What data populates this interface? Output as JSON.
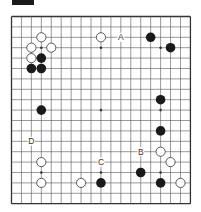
{
  "diagram": {
    "board_size": 19,
    "origin": {
      "x": 11.5,
      "y": 16.5
    },
    "spacing": {
      "x": 9.94,
      "y": 10.4
    },
    "colors": {
      "line": "#555555",
      "border": "#333333",
      "black_stone": "#1a1a1a",
      "white_stone_fill": "#ffffff",
      "white_stone_stroke": "#333333",
      "label": "#333333",
      "header": "#1a1a1a"
    },
    "star_points": [
      [
        3,
        3
      ],
      [
        9,
        3
      ],
      [
        15,
        3
      ],
      [
        3,
        9
      ],
      [
        9,
        9
      ],
      [
        15,
        9
      ],
      [
        3,
        15
      ],
      [
        9,
        15
      ],
      [
        15,
        15
      ]
    ],
    "white_stones": [
      [
        3,
        2
      ],
      [
        2,
        3
      ],
      [
        4,
        3
      ],
      [
        2,
        4
      ],
      [
        9,
        2
      ],
      [
        15,
        13
      ],
      [
        16,
        14
      ],
      [
        17,
        16
      ],
      [
        3,
        14
      ],
      [
        3,
        16
      ],
      [
        7,
        16
      ]
    ],
    "black_stones": [
      [
        3,
        4
      ],
      [
        2,
        5
      ],
      [
        3,
        5
      ],
      [
        14,
        2
      ],
      [
        16,
        3
      ],
      [
        15,
        8
      ],
      [
        15,
        11
      ],
      [
        13,
        15
      ],
      [
        15,
        16
      ],
      [
        3,
        9
      ],
      [
        9,
        16
      ]
    ],
    "labels": [
      {
        "text": "A",
        "col": 11,
        "row": 2
      },
      {
        "text": "B",
        "col": 13,
        "row": 13
      },
      {
        "text": "C",
        "col": 9,
        "row": 14
      },
      {
        "text": "D",
        "col": 2,
        "row": 12
      }
    ]
  }
}
